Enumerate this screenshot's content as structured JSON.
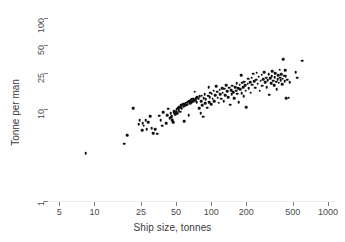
{
  "figure": {
    "title_remnant": "               ",
    "background": "#ffffff",
    "marker_color": "#101010",
    "grid_color": "#ededed",
    "axis_color": "#7d7d7d"
  },
  "chart_data": {
    "type": "scatter",
    "title": "",
    "xlabel": "Ship size, tonnes",
    "ylabel": "Tonne per man",
    "xscale": "log",
    "yscale": "log",
    "xlim": [
      4.0,
      1150
    ],
    "ylim": [
      1,
      115
    ],
    "grid": "horizontal",
    "legend": "none",
    "xticks": [
      5,
      10,
      25,
      50,
      100,
      200,
      500,
      1000
    ],
    "xtick_labels": [
      "5",
      "10",
      "25",
      "50",
      "100",
      "200",
      "500",
      "1000"
    ],
    "yticks": [
      1,
      10,
      25,
      50,
      100
    ],
    "ytick_labels": [
      "1",
      "10",
      "25",
      "50",
      "100"
    ],
    "n_points": 183,
    "points": [
      [
        8.4,
        3.3
      ],
      [
        18.0,
        4.2
      ],
      [
        19.0,
        5.2
      ],
      [
        21.5,
        10.2
      ],
      [
        24.0,
        6.9
      ],
      [
        24.5,
        7.6
      ],
      [
        25.5,
        5.9
      ],
      [
        26.0,
        7.0
      ],
      [
        26.5,
        6.6
      ],
      [
        27.5,
        7.6
      ],
      [
        28.0,
        6.1
      ],
      [
        29.0,
        7.2
      ],
      [
        30.0,
        8.4
      ],
      [
        31.0,
        6.2
      ],
      [
        32.0,
        5.5
      ],
      [
        33.0,
        6.1
      ],
      [
        34.5,
        5.4
      ],
      [
        36.0,
        8.5
      ],
      [
        37.0,
        7.6
      ],
      [
        38.0,
        6.6
      ],
      [
        39.0,
        9.3
      ],
      [
        41.0,
        7.1
      ],
      [
        42.0,
        8.6
      ],
      [
        43.0,
        10.1
      ],
      [
        44.0,
        8.0
      ],
      [
        45.0,
        9.1
      ],
      [
        45.5,
        8.2
      ],
      [
        46.0,
        8.5
      ],
      [
        46.5,
        7.6
      ],
      [
        47.0,
        7.2
      ],
      [
        48.0,
        9.2
      ],
      [
        48.5,
        9.6
      ],
      [
        49.0,
        8.8
      ],
      [
        50.0,
        9.4
      ],
      [
        50.5,
        10.0
      ],
      [
        51.0,
        9.0
      ],
      [
        52.0,
        10.3
      ],
      [
        52.5,
        9.7
      ],
      [
        53.0,
        10.5
      ],
      [
        54.0,
        9.4
      ],
      [
        55.0,
        10.6
      ],
      [
        55.5,
        11.0
      ],
      [
        56.0,
        10.2
      ],
      [
        57.0,
        11.3
      ],
      [
        58.0,
        10.8
      ],
      [
        58.5,
        7.4
      ],
      [
        59.0,
        11.5
      ],
      [
        60.0,
        11.0
      ],
      [
        61.0,
        11.8
      ],
      [
        62.0,
        11.2
      ],
      [
        63.0,
        12.0
      ],
      [
        64.0,
        8.6
      ],
      [
        65.0,
        12.2
      ],
      [
        66.0,
        11.6
      ],
      [
        67.0,
        12.5
      ],
      [
        68.0,
        12.0
      ],
      [
        69.0,
        12.8
      ],
      [
        70.0,
        12.3
      ],
      [
        71.0,
        13.0
      ],
      [
        72.0,
        15.5
      ],
      [
        73.0,
        12.6
      ],
      [
        74.0,
        13.3
      ],
      [
        75.0,
        12.0
      ],
      [
        76.0,
        13.6
      ],
      [
        78.0,
        13.0
      ],
      [
        79.0,
        10.3
      ],
      [
        80.0,
        13.8
      ],
      [
        81.0,
        9.0
      ],
      [
        82.0,
        12.2
      ],
      [
        83.0,
        14.0
      ],
      [
        84.0,
        11.0
      ],
      [
        85.0,
        8.3
      ],
      [
        86.0,
        13.2
      ],
      [
        88.0,
        14.5
      ],
      [
        89.0,
        11.6
      ],
      [
        90.0,
        12.8
      ],
      [
        92.0,
        10.4
      ],
      [
        94.0,
        14.0
      ],
      [
        95.0,
        17.5
      ],
      [
        96.0,
        12.0
      ],
      [
        97.0,
        13.5
      ],
      [
        98.0,
        15.2
      ],
      [
        100.0,
        11.4
      ],
      [
        101.0,
        14.8
      ],
      [
        103.0,
        13.0
      ],
      [
        105.0,
        16.0
      ],
      [
        106.0,
        12.3
      ],
      [
        108.0,
        14.3
      ],
      [
        110.0,
        17.8
      ],
      [
        112.0,
        15.5
      ],
      [
        114.0,
        13.4
      ],
      [
        116.0,
        11.8
      ],
      [
        118.0,
        16.4
      ],
      [
        120.0,
        14.6
      ],
      [
        122.0,
        13.0
      ],
      [
        124.0,
        17.0
      ],
      [
        126.0,
        15.2
      ],
      [
        128.0,
        12.2
      ],
      [
        130.0,
        16.7
      ],
      [
        132.0,
        14.2
      ],
      [
        135.0,
        18.4
      ],
      [
        137.0,
        15.8
      ],
      [
        140.0,
        13.5
      ],
      [
        142.0,
        17.2
      ],
      [
        145.0,
        11.2
      ],
      [
        148.0,
        16.2
      ],
      [
        150.0,
        14.6
      ],
      [
        152.0,
        18.0
      ],
      [
        155.0,
        15.4
      ],
      [
        158.0,
        13.2
      ],
      [
        160.0,
        17.5
      ],
      [
        163.0,
        16.0
      ],
      [
        165.0,
        19.2
      ],
      [
        168.0,
        14.8
      ],
      [
        170.0,
        17.0
      ],
      [
        172.0,
        12.0
      ],
      [
        175.0,
        18.6
      ],
      [
        178.0,
        16.5
      ],
      [
        180.0,
        23.5
      ],
      [
        182.0,
        15.0
      ],
      [
        185.0,
        19.5
      ],
      [
        188.0,
        17.3
      ],
      [
        190.0,
        13.8
      ],
      [
        192.0,
        20.0
      ],
      [
        195.0,
        18.2
      ],
      [
        198.0,
        16.0
      ],
      [
        200.0,
        10.6
      ],
      [
        205.0,
        19.0
      ],
      [
        208.0,
        21.5
      ],
      [
        210.0,
        17.0
      ],
      [
        215.0,
        19.8
      ],
      [
        218.0,
        15.2
      ],
      [
        222.0,
        22.0
      ],
      [
        225.0,
        18.5
      ],
      [
        230.0,
        24.5
      ],
      [
        235.0,
        20.2
      ],
      [
        238.0,
        17.2
      ],
      [
        242.0,
        21.0
      ],
      [
        246.0,
        25.0
      ],
      [
        250.0,
        19.0
      ],
      [
        255.0,
        22.6
      ],
      [
        260.0,
        16.0
      ],
      [
        265.0,
        20.5
      ],
      [
        270.0,
        23.8
      ],
      [
        275.0,
        18.0
      ],
      [
        280.0,
        21.4
      ],
      [
        285.0,
        25.5
      ],
      [
        290.0,
        19.6
      ],
      [
        295.0,
        22.0
      ],
      [
        300.0,
        17.5
      ],
      [
        305.0,
        20.8
      ],
      [
        310.0,
        24.0
      ],
      [
        315.0,
        14.4
      ],
      [
        320.0,
        21.8
      ],
      [
        325.0,
        19.2
      ],
      [
        330.0,
        23.0
      ],
      [
        335.0,
        26.0
      ],
      [
        340.0,
        20.4
      ],
      [
        345.0,
        18.4
      ],
      [
        350.0,
        22.4
      ],
      [
        355.0,
        24.8
      ],
      [
        360.0,
        20.0
      ],
      [
        365.0,
        16.5
      ],
      [
        370.0,
        21.2
      ],
      [
        375.0,
        23.4
      ],
      [
        380.0,
        19.4
      ],
      [
        385.0,
        27.0
      ],
      [
        390.0,
        22.0
      ],
      [
        395.0,
        20.6
      ],
      [
        400.0,
        24.2
      ],
      [
        405.0,
        18.8
      ],
      [
        410.0,
        21.6
      ],
      [
        415.0,
        35.0
      ],
      [
        420.0,
        23.2
      ],
      [
        425.0,
        20.2
      ],
      [
        430.0,
        26.5
      ],
      [
        435.0,
        22.8
      ],
      [
        440.0,
        13.2
      ],
      [
        450.0,
        21.0
      ],
      [
        460.0,
        13.4
      ],
      [
        470.0,
        19.8
      ],
      [
        530.0,
        25.5
      ],
      [
        545.0,
        22.2
      ],
      [
        600.0,
        34.0
      ]
    ]
  }
}
